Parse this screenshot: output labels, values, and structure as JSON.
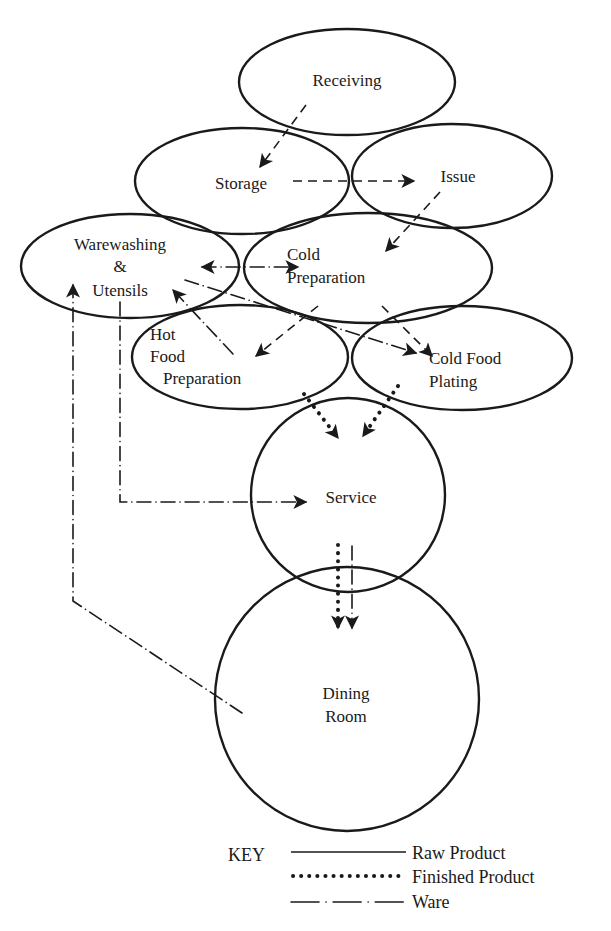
{
  "diagram": {
    "type": "food-service-flow",
    "areas": [
      {
        "id": "receiving",
        "label_lines": [
          "Receiving"
        ]
      },
      {
        "id": "storage",
        "label_lines": [
          "Storage"
        ]
      },
      {
        "id": "issue",
        "label_lines": [
          "Issue"
        ]
      },
      {
        "id": "warewashing",
        "label_lines": [
          "Warewashing",
          "&",
          "Utensils"
        ]
      },
      {
        "id": "cold_prep",
        "label_lines": [
          "Cold",
          "Preparation"
        ]
      },
      {
        "id": "hot_food",
        "label_lines": [
          "Hot",
          "Food",
          "Preparation"
        ]
      },
      {
        "id": "cold_plating",
        "label_lines": [
          "Cold Food",
          "Plating"
        ]
      },
      {
        "id": "service",
        "label_lines": [
          "Service"
        ]
      },
      {
        "id": "dining",
        "label_lines": [
          "Dining",
          "Room"
        ]
      }
    ],
    "flows": [
      {
        "from": "Receiving",
        "to": "Storage",
        "kind": "Raw Product"
      },
      {
        "from": "Storage",
        "to": "Issue",
        "kind": "Raw Product"
      },
      {
        "from": "Issue",
        "to": "Cold Preparation",
        "kind": "Raw Product"
      },
      {
        "from": "Cold Preparation",
        "to": "Hot Food Preparation",
        "kind": "Raw Product"
      },
      {
        "from": "Cold Preparation",
        "to": "Cold Food Plating",
        "kind": "Raw Product"
      },
      {
        "from": "Warewashing & Utensils",
        "to": "Cold Preparation",
        "kind": "Ware",
        "bidirectional": true
      },
      {
        "from": "Hot Food Preparation",
        "to": "Warewashing & Utensils",
        "kind": "Ware"
      },
      {
        "from": "Warewashing & Utensils",
        "to": "Cold Food Plating",
        "kind": "Ware"
      },
      {
        "from": "Warewashing & Utensils",
        "to": "Service",
        "kind": "Ware"
      },
      {
        "from": "Dining Room",
        "to": "Warewashing & Utensils",
        "kind": "Ware"
      },
      {
        "from": "Hot Food Preparation",
        "to": "Service",
        "kind": "Finished Product"
      },
      {
        "from": "Cold Food Plating",
        "to": "Service",
        "kind": "Finished Product"
      },
      {
        "from": "Service",
        "to": "Dining Room",
        "kind": "Finished Product"
      },
      {
        "from": "Service",
        "to": "Dining Room",
        "kind": "Ware"
      }
    ]
  },
  "key": {
    "title": "KEY",
    "items": [
      {
        "style": "solid",
        "label": "Raw Product"
      },
      {
        "style": "dotted",
        "label": "Finished Product"
      },
      {
        "style": "dash-dot",
        "label": "Ware"
      }
    ]
  }
}
